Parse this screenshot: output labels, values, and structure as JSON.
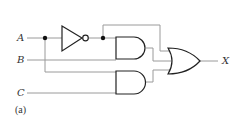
{
  "diagram": {
    "type": "logic-circuit",
    "inputs": [
      {
        "label": "A"
      },
      {
        "label": "B"
      },
      {
        "label": "C"
      }
    ],
    "output": {
      "label": "X"
    },
    "caption": "(a)",
    "gates": [
      {
        "id": "not1",
        "type": "NOT",
        "inputs": [
          "A"
        ]
      },
      {
        "id": "and1",
        "type": "AND",
        "inputs": [
          "NOT A",
          "B"
        ]
      },
      {
        "id": "and2",
        "type": "AND",
        "inputs": [
          "A",
          "C"
        ]
      },
      {
        "id": "or1",
        "type": "OR",
        "inputs": [
          "NOT A",
          "and1",
          "and2"
        ]
      }
    ],
    "colors": {
      "wire": "#999999",
      "gate": "#222222",
      "text": "#333333"
    }
  }
}
